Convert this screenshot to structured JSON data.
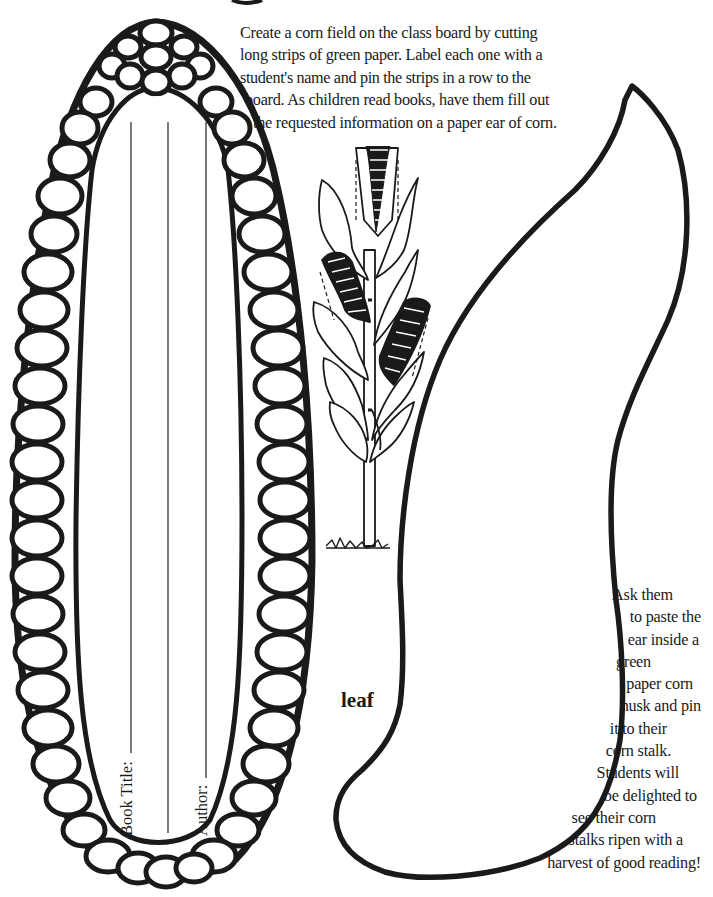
{
  "intro_text": {
    "lines": [
      "Create a corn field on the class board by cutting",
      "long strips of green paper. Label each one with a",
      "student's name and pin the strips in a row to the",
      " board. As children read books, have them fill out",
      "  the requested information on a paper ear of corn."
    ]
  },
  "side_text": {
    "lines": [
      "Ask them",
      "to paste the",
      "ear inside a",
      "green",
      "paper corn",
      "husk and pin",
      "it to their",
      "corn stalk.",
      "Students will",
      "be delighted to",
      "see their corn",
      "stalks ripen with a",
      "harvest of good reading!"
    ]
  },
  "leaf_template": {
    "label": "leaf"
  },
  "corn_ear_template": {
    "fields": [
      {
        "label": "Book Title:"
      },
      {
        "label": "Author:"
      }
    ]
  },
  "illustrations": {
    "corn_stalk": "corn-stalk-with-ears-icon",
    "corn_ear": "corn-ear-outline",
    "leaf": "leaf-outline"
  },
  "colors": {
    "ink": "#1a1a1a",
    "paper": "#ffffff"
  }
}
